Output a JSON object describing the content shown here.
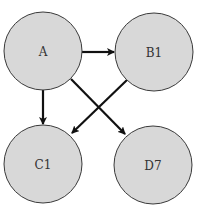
{
  "diagram": {
    "type": "directed-graph",
    "colors": {
      "node_fill": "#d8d8d8",
      "node_stroke": "#3a3a3a",
      "edge": "#111111",
      "label": "#333333"
    },
    "nodes": [
      {
        "id": "A",
        "label": "A",
        "cx": 43,
        "cy": 51,
        "r": 39
      },
      {
        "id": "B1",
        "label": "B1",
        "cx": 154,
        "cy": 52,
        "r": 39
      },
      {
        "id": "C1",
        "label": "C1",
        "cx": 43,
        "cy": 164,
        "r": 39
      },
      {
        "id": "D7",
        "label": "D7",
        "cx": 153,
        "cy": 165,
        "r": 39
      }
    ],
    "edges": [
      {
        "from": "A",
        "to": "B1"
      },
      {
        "from": "A",
        "to": "C1"
      },
      {
        "from": "A",
        "to": "D7"
      },
      {
        "from": "B1",
        "to": "C1"
      }
    ]
  }
}
